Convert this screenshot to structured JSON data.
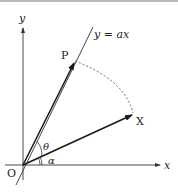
{
  "diagram": {
    "type": "geometric vector reflection diagram",
    "axes": {
      "x_label": "x",
      "y_label": "y",
      "origin_label": "O"
    },
    "line": {
      "label": "y = ax"
    },
    "points": {
      "P": "P",
      "X": "X"
    },
    "angles": {
      "theta": "θ",
      "alpha": "α"
    },
    "colors": {
      "stroke": "#1a1a1a",
      "background": "#ffffff",
      "top_border": "#b8b8b8"
    }
  }
}
